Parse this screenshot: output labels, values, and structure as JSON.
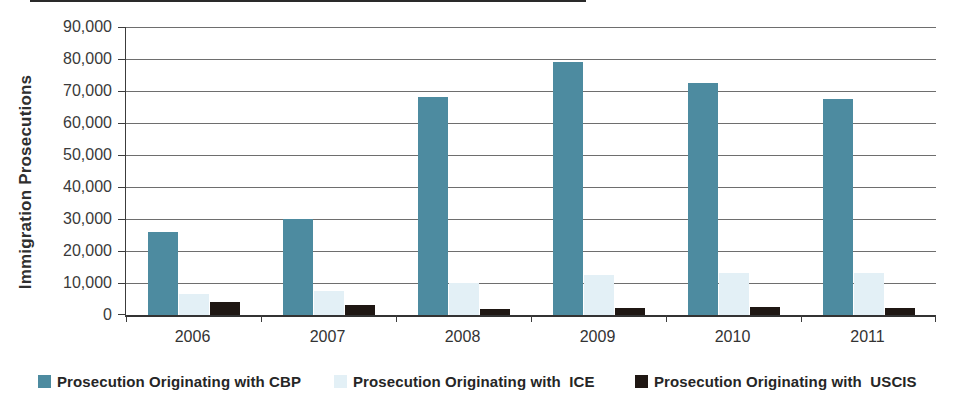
{
  "chart_data": {
    "type": "bar",
    "title": "",
    "xlabel": "",
    "ylabel": "Immigration Prosecutions",
    "ylim": [
      0,
      90000
    ],
    "ytick_interval": 10000,
    "y_tick_labels": [
      "0",
      "10,000",
      "20,000",
      "30,000",
      "40,000",
      "50,000",
      "60,000",
      "70,000",
      "80,000",
      "90,000"
    ],
    "grid": "horizontal",
    "legend_position": "bottom",
    "categories": [
      "2006",
      "2007",
      "2008",
      "2009",
      "2010",
      "2011"
    ],
    "series": [
      {
        "key": "cbp",
        "name": "Prosecution Originating with CBP",
        "color": "#4d8ba0",
        "values": [
          26000,
          30000,
          68000,
          79000,
          72500,
          67500
        ]
      },
      {
        "key": "ice",
        "name": "Prosecution Originating with  ICE",
        "color": "#e3f0f6",
        "values": [
          6500,
          7500,
          10000,
          12500,
          13000,
          13000
        ]
      },
      {
        "key": "uscis",
        "name": "Prosecution Originating with  USCIS",
        "color": "#1f1713",
        "values": [
          4000,
          3000,
          2000,
          2300,
          2400,
          2300
        ]
      }
    ]
  }
}
